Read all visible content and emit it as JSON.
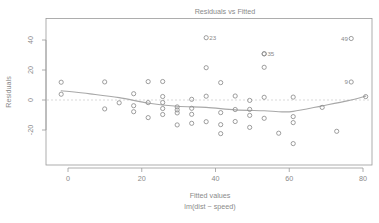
{
  "chart_data": {
    "type": "scatter",
    "title": "Residuals vs Fitted",
    "xlabel": "Fitted values",
    "xlabel_sub": "lm(dist ~ speed)",
    "ylabel": "Residuals",
    "xlim": [
      -5,
      85
    ],
    "ylim": [
      -32,
      46
    ],
    "xticks": [
      0,
      20,
      40,
      60,
      80
    ],
    "yticks": [
      40,
      20,
      0,
      -20
    ],
    "grid": false,
    "legend": null,
    "reference_line": {
      "y": 0,
      "style": "dotted"
    },
    "smoother": "loess",
    "x": [
      -1.85,
      -1.85,
      9.95,
      9.95,
      13.88,
      17.81,
      17.81,
      17.81,
      21.74,
      21.74,
      21.74,
      25.68,
      25.68,
      25.68,
      25.68,
      25.68,
      29.61,
      29.61,
      29.61,
      29.61,
      33.54,
      33.54,
      33.54,
      33.54,
      37.47,
      37.47,
      37.47,
      41.41,
      41.41,
      41.41,
      41.41,
      45.34,
      45.34,
      45.34,
      49.27,
      49.27,
      49.27,
      49.27,
      53.2,
      53.2,
      53.2,
      53.2,
      57.14,
      61.07,
      61.07,
      61.07,
      61.07,
      68.93,
      72.87,
      80.73
    ],
    "y": [
      3.85,
      11.85,
      -5.95,
      12.05,
      -1.88,
      -7.81,
      -3.81,
      4.19,
      -11.74,
      -1.74,
      12.26,
      -9.68,
      -5.68,
      -1.68,
      2.32,
      12.32,
      -16.61,
      -8.61,
      -6.61,
      -4.61,
      -15.54,
      -9.54,
      -5.54,
      0.46,
      -14.47,
      2.53,
      21.53,
      -22.41,
      -16.41,
      -8.41,
      11.59,
      -14.34,
      -6.34,
      2.66,
      -18.27,
      -10.27,
      -6.27,
      -0.27,
      -12.2,
      1.8,
      21.8,
      30.8,
      -22.14,
      -29.07,
      -15.07,
      -11.07,
      1.93,
      -4.93,
      -20.87,
      2.27
    ],
    "labeled_points": [
      {
        "id": "23",
        "x": 37.47,
        "y": 41.53,
        "side": "right"
      },
      {
        "id": "35",
        "x": 53.2,
        "y": 30.8,
        "side": "right"
      },
      {
        "id": "49",
        "x": 76.8,
        "y": 41.0,
        "side": "left"
      },
      {
        "id": "9",
        "x": 76.8,
        "y": 12.0,
        "side": "left"
      }
    ],
    "smoother_points": {
      "x": [
        -1.85,
        6,
        13.88,
        22,
        29.61,
        37.47,
        45.34,
        53.2,
        57.14,
        61.07,
        68.93,
        76,
        80.73
      ],
      "y": [
        6.2,
        4.1,
        1.6,
        -2.2,
        -4.2,
        -4.9,
        -6.6,
        -7.2,
        -7.8,
        -7.6,
        -3.9,
        -0.4,
        2.6
      ]
    }
  },
  "axis": {
    "x_tick_labels": [
      "0",
      "20",
      "40",
      "60",
      "80"
    ],
    "y_tick_labels": [
      "40",
      "20",
      "0",
      "-20"
    ]
  }
}
